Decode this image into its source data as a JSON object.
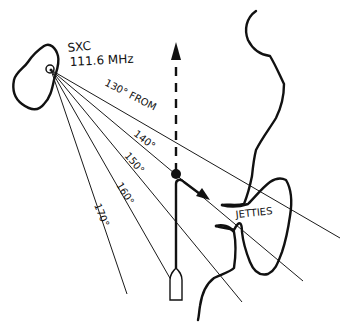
{
  "station": {
    "id": "SXC",
    "frequency": "111.6 MHz",
    "x": 50,
    "y": 70
  },
  "radials": [
    {
      "label": "130° FROM",
      "end": [
        340,
        238
      ],
      "label_pos": [
        104,
        85
      ],
      "label_rot": 27
    },
    {
      "label": "140°",
      "end": [
        303,
        281
      ],
      "label_pos": [
        133,
        135
      ],
      "label_rot": 38
    },
    {
      "label": "150°",
      "end": [
        242,
        302
      ],
      "label_pos": [
        124,
        156
      ],
      "label_rot": 49
    },
    {
      "label": "160°",
      "end": [
        171,
        280
      ],
      "label_pos": [
        116,
        185
      ],
      "label_rot": 58
    },
    {
      "label": "170°",
      "end": [
        127,
        294
      ],
      "label_pos": [
        94,
        208
      ],
      "label_rot": 68
    }
  ],
  "labels": {
    "jetties": "JETTIES"
  },
  "colors": {
    "ink": "#111111",
    "background": "#ffffff"
  }
}
